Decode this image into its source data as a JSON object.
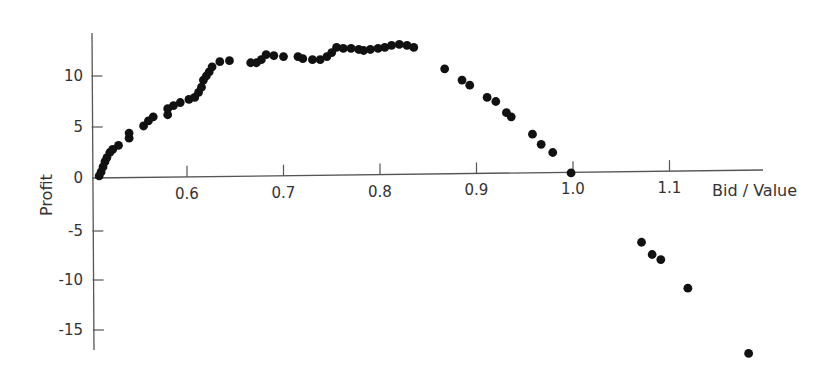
{
  "chart_data": {
    "type": "scatter",
    "title": "",
    "xlabel": "Bid / Value",
    "ylabel": "Profit",
    "xlim": [
      0.5,
      1.19
    ],
    "ylim": [
      -16.5,
      14
    ],
    "grid": false,
    "legend": null,
    "x_ticks": [
      0.6,
      0.7,
      0.8,
      0.9,
      1.0,
      1.1
    ],
    "x_tick_labels": [
      "0.6",
      "0.7",
      "0.8",
      "0.9",
      "1.0",
      "1.1"
    ],
    "y_ticks": [
      -15,
      -10,
      -5,
      0,
      5,
      10
    ],
    "y_tick_labels": [
      "-15",
      "-10",
      "-5",
      "0",
      "5",
      "10"
    ],
    "marker_color": "#111111",
    "axis_color": "#555555",
    "series": [
      {
        "name": "Profit",
        "points": [
          [
            0.509,
            0.2
          ],
          [
            0.511,
            0.6
          ],
          [
            0.513,
            1.1
          ],
          [
            0.515,
            1.6
          ],
          [
            0.517,
            2.0
          ],
          [
            0.52,
            2.5
          ],
          [
            0.523,
            2.8
          ],
          [
            0.529,
            3.2
          ],
          [
            0.54,
            3.9
          ],
          [
            0.54,
            4.4
          ],
          [
            0.555,
            5.1
          ],
          [
            0.56,
            5.6
          ],
          [
            0.565,
            6.0
          ],
          [
            0.58,
            6.2
          ],
          [
            0.58,
            6.8
          ],
          [
            0.586,
            7.1
          ],
          [
            0.593,
            7.4
          ],
          [
            0.602,
            7.7
          ],
          [
            0.608,
            7.9
          ],
          [
            0.612,
            8.4
          ],
          [
            0.615,
            8.9
          ],
          [
            0.617,
            9.6
          ],
          [
            0.62,
            10.0
          ],
          [
            0.623,
            10.4
          ],
          [
            0.626,
            10.9
          ],
          [
            0.634,
            11.4
          ],
          [
            0.644,
            11.5
          ],
          [
            0.666,
            11.3
          ],
          [
            0.672,
            11.3
          ],
          [
            0.677,
            11.6
          ],
          [
            0.682,
            12.1
          ],
          [
            0.69,
            12.0
          ],
          [
            0.7,
            11.9
          ],
          [
            0.715,
            11.9
          ],
          [
            0.72,
            11.7
          ],
          [
            0.73,
            11.6
          ],
          [
            0.738,
            11.6
          ],
          [
            0.745,
            11.9
          ],
          [
            0.75,
            12.3
          ],
          [
            0.755,
            12.8
          ],
          [
            0.762,
            12.7
          ],
          [
            0.77,
            12.7
          ],
          [
            0.778,
            12.6
          ],
          [
            0.783,
            12.5
          ],
          [
            0.79,
            12.6
          ],
          [
            0.798,
            12.7
          ],
          [
            0.805,
            12.8
          ],
          [
            0.812,
            13.0
          ],
          [
            0.82,
            13.1
          ],
          [
            0.828,
            13.0
          ],
          [
            0.835,
            12.8
          ],
          [
            0.867,
            10.7
          ],
          [
            0.885,
            9.6
          ],
          [
            0.893,
            9.1
          ],
          [
            0.911,
            7.9
          ],
          [
            0.92,
            7.5
          ],
          [
            0.931,
            6.4
          ],
          [
            0.936,
            6.0
          ],
          [
            0.958,
            4.3
          ],
          [
            0.967,
            3.3
          ],
          [
            0.979,
            2.5
          ],
          [
            0.998,
            0.5
          ],
          [
            1.071,
            -6.3
          ],
          [
            1.082,
            -7.5
          ],
          [
            1.091,
            -8.0
          ],
          [
            1.119,
            -10.8
          ],
          [
            1.182,
            -17.2
          ]
        ]
      }
    ]
  }
}
